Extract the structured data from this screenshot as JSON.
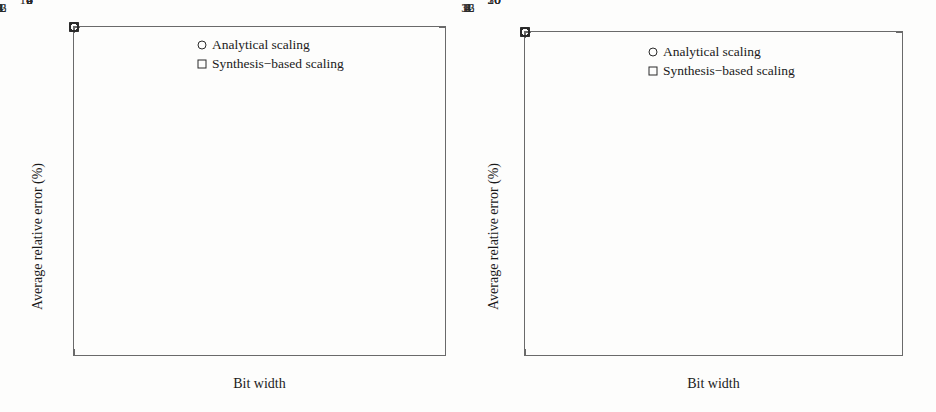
{
  "figure": {
    "background_color": "#fdfdfc",
    "marker_color": "#2b2b2b",
    "axis_color": "#6a6a6a"
  },
  "chart_data": [
    {
      "id": "left",
      "type": "scatter",
      "title": "",
      "xlabel": "Bit width",
      "ylabel": "Average relative error (%)",
      "categories": [
        "1",
        "2",
        "4",
        "8",
        "16",
        "32"
      ],
      "x": [
        1,
        2,
        4,
        8,
        16,
        32
      ],
      "xscale": "categorical",
      "ylim": [
        0,
        10
      ],
      "yticks": [
        0,
        2,
        4,
        6,
        8,
        10
      ],
      "yminorticks": [
        1,
        3,
        5,
        7,
        9
      ],
      "grid": false,
      "legend_position": "top-center",
      "series": [
        {
          "name": "Analytical scaling",
          "marker": "circle",
          "values": [
            8.6,
            7.6,
            3.25,
            0.62,
            0.95,
            1.55
          ]
        },
        {
          "name": "Synthesis−based scaling",
          "marker": "square",
          "values": [
            9.5,
            3.72,
            2.78,
            0.6,
            0.85,
            1.4
          ]
        }
      ]
    },
    {
      "id": "right",
      "type": "scatter",
      "title": "",
      "xlabel": "Bit width",
      "ylabel": "Average relative error (%)",
      "categories": [
        "1",
        "2",
        "4",
        "8",
        "16",
        "32"
      ],
      "x": [
        1,
        2,
        4,
        8,
        16,
        32
      ],
      "xscale": "categorical",
      "ylim": [
        0,
        34.3
      ],
      "yticks": [
        0,
        10,
        20,
        30
      ],
      "yminorticks": [
        5,
        15,
        25
      ],
      "grid": false,
      "legend_position": "top-center",
      "series": [
        {
          "name": "Analytical scaling",
          "marker": "circle",
          "values": [
            30.3,
            25.4,
            11.8,
            5.2,
            6.3,
            6.3
          ]
        },
        {
          "name": "Synthesis−based scaling",
          "marker": "square",
          "values": [
            15.2,
            8.3,
            11.0,
            5.1,
            3.0,
            3.6
          ]
        }
      ]
    }
  ],
  "panels": {
    "left": {
      "ylabel": "Average relative error (%)",
      "xlabel": "Bit width",
      "ytick_labels": [
        "0",
        "2",
        "4",
        "6",
        "8",
        "10"
      ],
      "xtick_labels": [
        "1",
        "2",
        "4",
        "8",
        "16",
        "32"
      ],
      "legend": {
        "items": [
          {
            "glyph": "circle-marker-icon",
            "label": "Analytical scaling"
          },
          {
            "glyph": "square-marker-icon",
            "label": "Synthesis−based scaling"
          }
        ]
      }
    },
    "right": {
      "ylabel": "Average relative error (%)",
      "xlabel": "Bit width",
      "ytick_labels": [
        "0",
        "10",
        "20",
        "30"
      ],
      "xtick_labels": [
        "1",
        "2",
        "4",
        "8",
        "16",
        "32"
      ],
      "legend": {
        "items": [
          {
            "glyph": "circle-marker-icon",
            "label": "Analytical scaling"
          },
          {
            "glyph": "square-marker-icon",
            "label": "Synthesis−based scaling"
          }
        ]
      }
    }
  }
}
